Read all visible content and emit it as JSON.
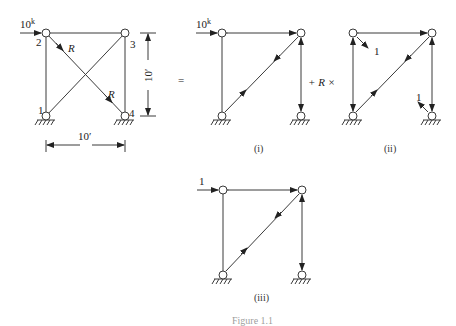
{
  "figure": {
    "main": {
      "load": "10",
      "load_sup": "k",
      "nodes": [
        "1",
        "2",
        "3",
        "4"
      ],
      "redundant_label": "R",
      "height_dim": "10′",
      "width_dim": "10′"
    },
    "equals": "=",
    "plus_r_times": "+  R  ×",
    "case_i": {
      "load": "10",
      "load_sup": "k",
      "caption": "(i)"
    },
    "case_ii": {
      "unit_label_top": "1",
      "unit_label_bottom": "1",
      "caption": "(ii)"
    },
    "case_iii": {
      "load": "1",
      "caption": "(iii)"
    },
    "caption": "Figure 1.1"
  },
  "colors": {
    "line": "#3a3a3a",
    "background": "#ffffff"
  }
}
